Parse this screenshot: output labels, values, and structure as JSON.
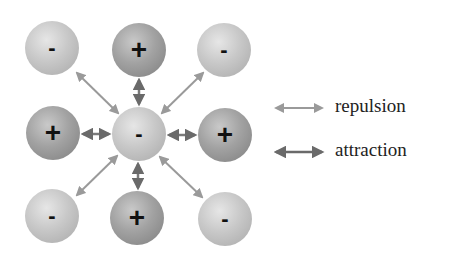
{
  "diagram": {
    "type": "ionic-lattice-interactions",
    "central_ion": {
      "sign": "-",
      "label": "−"
    },
    "ions": [
      {
        "pos": "top-left",
        "sign": "-",
        "label": "-",
        "cx": 52,
        "cy": 48
      },
      {
        "pos": "top-center",
        "sign": "+",
        "label": "+",
        "cx": 139,
        "cy": 50
      },
      {
        "pos": "top-right",
        "sign": "-",
        "label": "-",
        "cx": 224,
        "cy": 50
      },
      {
        "pos": "middle-left",
        "sign": "+",
        "label": "+",
        "cx": 53,
        "cy": 133
      },
      {
        "pos": "center",
        "sign": "-",
        "label": "-",
        "cx": 139,
        "cy": 134
      },
      {
        "pos": "middle-right",
        "sign": "+",
        "label": "+",
        "cx": 225,
        "cy": 135
      },
      {
        "pos": "bottom-left",
        "sign": "-",
        "label": "-",
        "cx": 52,
        "cy": 216
      },
      {
        "pos": "bottom-center",
        "sign": "+",
        "label": "+",
        "cx": 137,
        "cy": 218
      },
      {
        "pos": "bottom-right",
        "sign": "-",
        "label": "-",
        "cx": 225,
        "cy": 219
      }
    ],
    "legend": {
      "repulsion": {
        "label": "repulsion",
        "color": "#9a9a9a"
      },
      "attraction": {
        "label": "attraction",
        "color": "#6a6a6a"
      }
    }
  }
}
